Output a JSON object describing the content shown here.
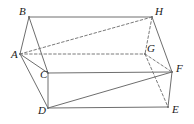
{
  "figure": {
    "background_color": "#ffffff",
    "stroke_color": "#6e6e6e",
    "hidden_stroke_color": "#7a7a7a",
    "label_color": "#1a1a1a",
    "stroke_width": 1,
    "canvas": {
      "width": 194,
      "height": 124
    }
  },
  "vertices": [
    {
      "id": "A",
      "label": "A",
      "x": 20,
      "y": 54,
      "label_x": 11,
      "label_y": 58,
      "hidden": false
    },
    {
      "id": "B",
      "label": "B",
      "x": 29,
      "y": 17,
      "label_x": 19,
      "label_y": 15,
      "hidden": false
    },
    {
      "id": "C",
      "label": "C",
      "x": 48,
      "y": 73,
      "label_x": 40,
      "label_y": 78,
      "hidden": false
    },
    {
      "id": "D",
      "label": "D",
      "x": 48,
      "y": 108,
      "label_x": 38,
      "label_y": 114,
      "hidden": false
    },
    {
      "id": "E",
      "label": "E",
      "x": 168,
      "y": 107,
      "label_x": 172,
      "label_y": 113,
      "hidden": false
    },
    {
      "id": "F",
      "label": "F",
      "x": 172,
      "y": 72,
      "label_x": 176,
      "label_y": 72,
      "hidden": false
    },
    {
      "id": "G",
      "label": "G",
      "x": 145,
      "y": 54,
      "label_x": 147,
      "label_y": 52,
      "hidden": true
    },
    {
      "id": "H",
      "label": "H",
      "x": 152,
      "y": 17,
      "label_x": 155,
      "label_y": 15,
      "hidden": false
    }
  ],
  "edges": [
    {
      "id": "BH",
      "from": "B",
      "to": "H",
      "style": "solid",
      "kind": "edge",
      "name": "edge-b-h"
    },
    {
      "id": "BA",
      "from": "B",
      "to": "A",
      "style": "solid",
      "kind": "edge",
      "name": "edge-b-a"
    },
    {
      "id": "BC",
      "from": "B",
      "to": "C",
      "style": "solid",
      "kind": "edge",
      "name": "edge-b-c"
    },
    {
      "id": "AC",
      "from": "A",
      "to": "C",
      "style": "solid",
      "kind": "edge",
      "name": "edge-a-c"
    },
    {
      "id": "AD",
      "from": "A",
      "to": "D",
      "style": "solid",
      "kind": "edge",
      "name": "edge-a-d"
    },
    {
      "id": "CD",
      "from": "C",
      "to": "D",
      "style": "solid",
      "kind": "edge",
      "name": "edge-c-d"
    },
    {
      "id": "CF",
      "from": "C",
      "to": "F",
      "style": "solid",
      "kind": "edge",
      "name": "edge-c-f"
    },
    {
      "id": "DE",
      "from": "D",
      "to": "E",
      "style": "solid",
      "kind": "edge",
      "name": "edge-d-e"
    },
    {
      "id": "EF",
      "from": "E",
      "to": "F",
      "style": "solid",
      "kind": "edge",
      "name": "edge-e-f"
    },
    {
      "id": "HF",
      "from": "H",
      "to": "F",
      "style": "solid",
      "kind": "edge",
      "name": "edge-h-f"
    },
    {
      "id": "AH",
      "from": "A",
      "to": "H",
      "style": "dashed",
      "kind": "diagonal",
      "name": "diagonal-a-h"
    },
    {
      "id": "DF",
      "from": "D",
      "to": "F",
      "style": "solid",
      "kind": "diagonal",
      "name": "diagonal-d-f"
    },
    {
      "id": "AG",
      "from": "A",
      "to": "G",
      "style": "dashed",
      "kind": "hidden-edge",
      "name": "hidden-edge-a-g"
    },
    {
      "id": "HG",
      "from": "H",
      "to": "G",
      "style": "dashed",
      "kind": "hidden-edge",
      "name": "hidden-edge-h-g"
    },
    {
      "id": "GF",
      "from": "G",
      "to": "F",
      "style": "dashed",
      "kind": "hidden-edge",
      "name": "hidden-edge-g-f"
    },
    {
      "id": "GE",
      "from": "G",
      "to": "E",
      "style": "dashed",
      "kind": "hidden-edge",
      "name": "hidden-edge-g-e"
    }
  ]
}
